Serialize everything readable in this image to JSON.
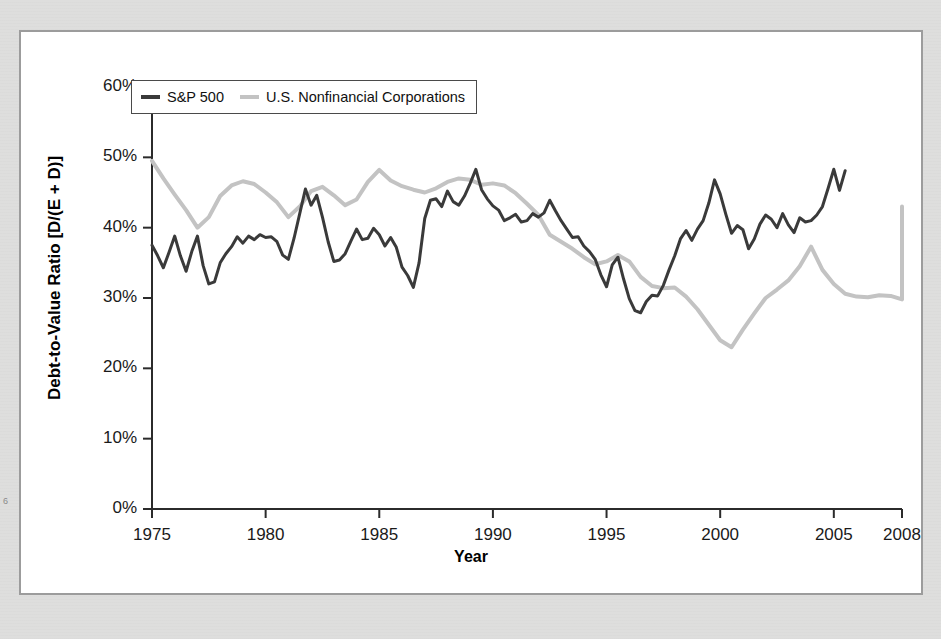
{
  "figure": {
    "background_color": "#dededd",
    "panel_color": "#ffffff",
    "panel_border_color": "#9c9c9c"
  },
  "legend": {
    "position": "top-left-inside",
    "entries": [
      {
        "label": "S&P 500",
        "color": "#3a3a3a",
        "marker": "line-swatch"
      },
      {
        "label": "U.S. Nonfinancial Corporations",
        "color": "#c3c3c3",
        "marker": "line-swatch"
      }
    ]
  },
  "axes": {
    "y_title": "Debt-to-Value Ratio [D/(E + D)]",
    "x_title": "Year",
    "y_ticks": [
      "0%",
      "10%",
      "20%",
      "30%",
      "40%",
      "50%",
      "60%"
    ],
    "x_ticks": [
      "1975",
      "1980",
      "1985",
      "1990",
      "1995",
      "2000",
      "2005",
      "2008"
    ]
  },
  "margin_note": "6",
  "chart_data": {
    "type": "line",
    "title": "",
    "xlabel": "Year",
    "ylabel": "Debt-to-Value Ratio [D/(E + D)]",
    "xlim": [
      1975,
      2008
    ],
    "ylim": [
      0,
      60
    ],
    "y_tick_values": [
      0,
      10,
      20,
      30,
      40,
      50,
      60
    ],
    "y_tick_labels": [
      "0%",
      "10%",
      "20%",
      "30%",
      "40%",
      "50%",
      "60%"
    ],
    "x_tick_values": [
      1975,
      1980,
      1985,
      1990,
      1995,
      2000,
      2005,
      2008
    ],
    "x_tick_labels": [
      "1975",
      "1980",
      "1985",
      "1990",
      "1995",
      "2000",
      "2005",
      "2008"
    ],
    "grid": false,
    "legend_position": "upper left",
    "units": "percent",
    "x_step": 0.25,
    "series": [
      {
        "name": "S&P 500",
        "color": "#3a3a3a",
        "line_width": 3,
        "x_start": 1975,
        "x_step": 0.25,
        "values": [
          37.5,
          36.0,
          34.3,
          36.5,
          38.8,
          36.0,
          33.8,
          36.6,
          38.8,
          34.6,
          32.0,
          32.3,
          35.0,
          36.3,
          37.3,
          38.7,
          37.8,
          38.8,
          38.3,
          39.0,
          38.6,
          38.7,
          38.0,
          36.1,
          35.5,
          38.5,
          42.0,
          45.5,
          43.2,
          44.6,
          41.5,
          38.0,
          35.2,
          35.4,
          36.3,
          38.1,
          39.8,
          38.3,
          38.5,
          39.9,
          39.0,
          37.4,
          38.6,
          37.2,
          34.4,
          33.2,
          31.5,
          35.0,
          41.3,
          43.9,
          44.1,
          43.0,
          45.2,
          43.7,
          43.2,
          44.5,
          46.3,
          48.3,
          45.4,
          44.1,
          43.1,
          42.5,
          41.0,
          41.4,
          41.9,
          40.8,
          41.0,
          42.0,
          41.5,
          42.1,
          43.9,
          42.4,
          41.0,
          39.8,
          38.6,
          38.7,
          37.4,
          36.6,
          35.5,
          33.3,
          31.6,
          34.7,
          35.8,
          32.7,
          29.9,
          28.2,
          27.9,
          29.5,
          30.4,
          30.3,
          31.8,
          34.0,
          36.0,
          38.4,
          39.6,
          38.2,
          39.8,
          41.0,
          43.5,
          46.8,
          44.8,
          41.9,
          39.2,
          40.3,
          39.7,
          37.0,
          38.4,
          40.5,
          41.8,
          41.2,
          40.0,
          42.0,
          40.4,
          39.3,
          41.4,
          40.8,
          41.0,
          41.8,
          43.0,
          45.6,
          48.3,
          45.3,
          48.1
        ]
      },
      {
        "name": "U.S. Nonfinancial Corporations",
        "color": "#c3c3c3",
        "line_width": 4,
        "x_start": 1975,
        "x_step": 0.5,
        "values": [
          49.5,
          47.0,
          44.7,
          42.5,
          40.0,
          41.5,
          44.5,
          46.0,
          46.6,
          46.2,
          45.0,
          43.6,
          41.5,
          43.0,
          45.2,
          45.8,
          44.6,
          43.2,
          44.0,
          46.5,
          48.2,
          46.7,
          45.9,
          45.4,
          45.0,
          45.6,
          46.5,
          47.0,
          46.8,
          46.1,
          46.3,
          46.0,
          44.9,
          43.4,
          41.8,
          39.0,
          38.0,
          37.0,
          35.8,
          34.8,
          35.2,
          36.1,
          35.2,
          33.0,
          31.7,
          31.4,
          31.5,
          30.2,
          28.4,
          26.2,
          24.0,
          23.0,
          25.5,
          27.8,
          30.0,
          31.2,
          32.5,
          34.5,
          37.3,
          34.0,
          32.0,
          30.6,
          30.2,
          30.1,
          30.4,
          30.3,
          29.8,
          30.3,
          31.0,
          36.5,
          43.0
        ]
      }
    ]
  }
}
